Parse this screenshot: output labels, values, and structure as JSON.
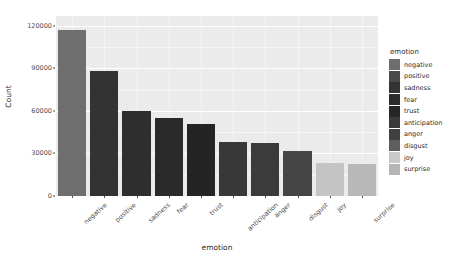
{
  "chart_data": {
    "type": "bar",
    "title": "",
    "xlabel": "emotion",
    "ylabel": "Count",
    "categories": [
      "negative",
      "positive",
      "sadness",
      "fear",
      "trust",
      "anticipation",
      "anger",
      "disgust",
      "joy",
      "surprise"
    ],
    "values": [
      117000,
      88000,
      60000,
      55000,
      51000,
      38000,
      37500,
      32000,
      23000,
      22500
    ],
    "ylim": [
      0,
      127000
    ],
    "yticks": [
      0,
      30000,
      60000,
      90000,
      120000
    ],
    "ytick_labels": [
      "0",
      "30000",
      "60000",
      "90000",
      "120000"
    ],
    "grid": true,
    "legend_position": "right",
    "legend_title": "emotion",
    "series_colors": [
      "#6e6e6e",
      "#353535",
      "#303030",
      "#2c2c2c",
      "#262626",
      "#3a3a3a",
      "#3d3d3d",
      "#464646",
      "#7d7d7d",
      "#c9c9c9",
      "#bdbdbd",
      "#b3b3b3"
    ],
    "bar_colors": [
      "#6e6e6e",
      "#333333",
      "#2e2e2e",
      "#2a2a2a",
      "#242424",
      "#383838",
      "#3b3b3b",
      "#454545",
      "#c4c4c4",
      "#b8b8b8"
    ],
    "legend_items": [
      {
        "label": "negative",
        "color": "#6e6e6e"
      },
      {
        "label": "positive",
        "color": "#4a4a4a"
      },
      {
        "label": "sadness",
        "color": "#333333"
      },
      {
        "label": "fear",
        "color": "#2c2c2c"
      },
      {
        "label": "trust",
        "color": "#262626"
      },
      {
        "label": "anticipation",
        "color": "#3a3a3a"
      },
      {
        "label": "anger",
        "color": "#404040"
      },
      {
        "label": "disgust",
        "color": "#5e5e5e"
      },
      {
        "label": "joy",
        "color": "#c9c9c9"
      },
      {
        "label": "surprise",
        "color": "#b5b5b5"
      }
    ],
    "panel_background": "#ebebeb",
    "gridline_color": "#ffffff"
  }
}
